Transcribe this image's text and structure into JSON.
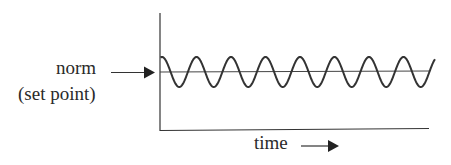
{
  "labels": {
    "norm": "norm",
    "set_point": "(set point)",
    "time": "time"
  },
  "colors": {
    "line": "#333333",
    "background": "#ffffff"
  },
  "chart_data": {
    "type": "line",
    "title": "",
    "xlabel": "time →",
    "ylabel": "",
    "annotations": [
      "norm (set point) → horizontal reference line"
    ],
    "series": [
      {
        "name": "oscillation around set point",
        "shape": "sine",
        "cycles": 8,
        "amplitude_relative": 1,
        "baseline": "norm (set point)"
      },
      {
        "name": "norm (set point)",
        "shape": "horizontal line"
      }
    ],
    "grid": false
  }
}
